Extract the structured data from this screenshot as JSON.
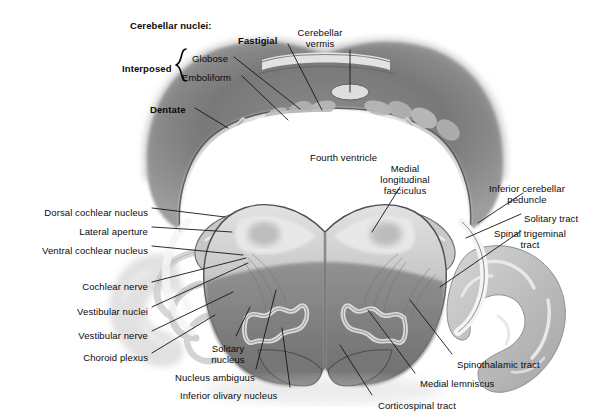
{
  "figure": {
    "domain": "anatomical-illustration",
    "style": "grayscale pencil/airbrush rendering on white background",
    "width": 615,
    "height": 418
  },
  "group_headers": {
    "cerebellar_nuclei": "Cerebellar nuclei:",
    "interposed": "Interposed"
  },
  "labels": [
    {
      "id": "cerebellar-nuclei-header",
      "text": "Cerebellar nuclei:",
      "bold": true,
      "x": 130,
      "y": 20,
      "align": "left"
    },
    {
      "id": "fastigial",
      "text": "Fastigial",
      "bold": true,
      "x": 238,
      "y": 35,
      "align": "left"
    },
    {
      "id": "cerebellar-vermis",
      "text": "Cerebellar\nvermis",
      "bold": false,
      "x": 320,
      "y": 27,
      "align": "center"
    },
    {
      "id": "interposed",
      "text": "Interposed",
      "bold": true,
      "x": 122,
      "y": 63,
      "align": "left"
    },
    {
      "id": "globose",
      "text": "Globose",
      "bold": false,
      "x": 192,
      "y": 53,
      "align": "left"
    },
    {
      "id": "emboliform",
      "text": "Emboliform",
      "bold": false,
      "x": 182,
      "y": 72,
      "align": "left"
    },
    {
      "id": "dentate",
      "text": "Dentate",
      "bold": true,
      "x": 150,
      "y": 104,
      "align": "left"
    },
    {
      "id": "fourth-ventricle",
      "text": "Fourth ventricle",
      "bold": false,
      "x": 310,
      "y": 152,
      "align": "left"
    },
    {
      "id": "medial-longitudinal-fasciculus",
      "text": "Medial\nlongitudinal\nfasciculus",
      "bold": false,
      "x": 405,
      "y": 163,
      "align": "center"
    },
    {
      "id": "inferior-cerebellar-peduncle",
      "text": "Inferior cerebellar\npeduncle",
      "bold": false,
      "x": 527,
      "y": 183,
      "align": "center"
    },
    {
      "id": "solitary-tract",
      "text": "Solitary tract",
      "bold": false,
      "x": 524,
      "y": 213,
      "align": "left"
    },
    {
      "id": "spinal-trigeminal-tract",
      "text": "Spinal trigeminal\ntract",
      "bold": false,
      "x": 530,
      "y": 228,
      "align": "center"
    },
    {
      "id": "dorsal-cochlear-nucleus",
      "text": "Dorsal cochlear nucleus",
      "bold": false,
      "x": 148,
      "y": 207,
      "align": "right"
    },
    {
      "id": "lateral-aperture",
      "text": "Lateral aperture",
      "bold": false,
      "x": 148,
      "y": 226,
      "align": "right"
    },
    {
      "id": "ventral-cochlear-nucleus",
      "text": "Ventral cochlear nucleus",
      "bold": false,
      "x": 148,
      "y": 245,
      "align": "right"
    },
    {
      "id": "cochlear-nerve",
      "text": "Cochlear nerve",
      "bold": false,
      "x": 148,
      "y": 281,
      "align": "right"
    },
    {
      "id": "vestibular-nuclei",
      "text": "Vestibular nuclei",
      "bold": false,
      "x": 148,
      "y": 306,
      "align": "right"
    },
    {
      "id": "vestibular-nerve",
      "text": "Vestibular nerve",
      "bold": false,
      "x": 148,
      "y": 330,
      "align": "right"
    },
    {
      "id": "choroid-plexus",
      "text": "Choroid plexus",
      "bold": false,
      "x": 148,
      "y": 352,
      "align": "right"
    },
    {
      "id": "solitary-nucleus",
      "text": "Solitary\nnucleus",
      "bold": false,
      "x": 228,
      "y": 343,
      "align": "center"
    },
    {
      "id": "nucleus-ambiguus",
      "text": "Nucleus ambiguus",
      "bold": false,
      "x": 175,
      "y": 372,
      "align": "left"
    },
    {
      "id": "inferior-olivary-nucleus",
      "text": "Inferior olivary nucleus",
      "bold": false,
      "x": 180,
      "y": 390,
      "align": "left"
    },
    {
      "id": "corticospinal-tract",
      "text": "Corticospinal tract",
      "bold": false,
      "x": 378,
      "y": 400,
      "align": "left"
    },
    {
      "id": "medial-lemniscus",
      "text": "Medial lemniscus",
      "bold": false,
      "x": 420,
      "y": 378,
      "align": "left"
    },
    {
      "id": "spinothalamic-tract",
      "text": "Spinothalamic tract",
      "bold": false,
      "x": 457,
      "y": 359,
      "align": "left"
    }
  ],
  "leader_lines": [
    {
      "id": "leader-fastigial",
      "from": [
        288,
        44
      ],
      "to": [
        322,
        110
      ]
    },
    {
      "id": "leader-vermis",
      "from": [
        350,
        50
      ],
      "to": [
        350,
        92
      ]
    },
    {
      "id": "leader-globose",
      "from": [
        234,
        57
      ],
      "to": [
        300,
        109
      ]
    },
    {
      "id": "leader-emboliform",
      "from": [
        242,
        76
      ],
      "to": [
        288,
        120
      ]
    },
    {
      "id": "leader-dentate",
      "from": [
        195,
        108
      ],
      "to": [
        228,
        128
      ]
    },
    {
      "id": "leader-mlf",
      "from": [
        400,
        187
      ],
      "to": [
        372,
        232
      ]
    },
    {
      "id": "leader-icp",
      "from": [
        523,
        193
      ],
      "to": [
        478,
        223
      ]
    },
    {
      "id": "leader-sol-tract",
      "from": [
        521,
        214
      ],
      "to": [
        466,
        238
      ]
    },
    {
      "id": "leader-spinal-trig",
      "from": [
        521,
        231
      ],
      "to": [
        440,
        287
      ]
    },
    {
      "id": "leader-dcn",
      "from": [
        152,
        208
      ],
      "to": [
        225,
        217
      ]
    },
    {
      "id": "leader-lat-ap",
      "from": [
        152,
        227
      ],
      "to": [
        232,
        232
      ]
    },
    {
      "id": "leader-vcn",
      "from": [
        152,
        246
      ],
      "to": [
        243,
        255
      ]
    },
    {
      "id": "leader-coch-nerve",
      "from": [
        152,
        282
      ],
      "to": [
        246,
        258
      ]
    },
    {
      "id": "leader-vest-nuclei",
      "from": [
        152,
        307
      ],
      "to": [
        248,
        263
      ]
    },
    {
      "id": "leader-vest-nerve",
      "from": [
        152,
        331
      ],
      "to": [
        233,
        292
      ]
    },
    {
      "id": "leader-choroid",
      "from": [
        152,
        353
      ],
      "to": [
        215,
        315
      ]
    },
    {
      "id": "leader-sol-nucleus",
      "from": [
        236,
        336
      ],
      "to": [
        250,
        307
      ]
    },
    {
      "id": "leader-nuc-amb",
      "from": [
        256,
        369
      ],
      "to": [
        276,
        290
      ]
    },
    {
      "id": "leader-inf-olivary",
      "from": [
        290,
        387
      ],
      "to": [
        282,
        328
      ]
    },
    {
      "id": "leader-cortico",
      "from": [
        372,
        395
      ],
      "to": [
        340,
        345
      ]
    },
    {
      "id": "leader-med-lemn",
      "from": [
        415,
        373
      ],
      "to": [
        368,
        310
      ]
    },
    {
      "id": "leader-spinothal",
      "from": [
        452,
        354
      ],
      "to": [
        410,
        300
      ]
    }
  ],
  "anatomy_regions": [
    {
      "id": "cerebellum-arch",
      "name": "cerebellar hemispheres forming arch above fourth ventricle"
    },
    {
      "id": "fourth-ventricle-cavity",
      "name": "fourth ventricle (white cavity)"
    },
    {
      "id": "vermis-oval",
      "name": "cerebellar vermis small oval at apex"
    },
    {
      "id": "dentate-nucleus-left",
      "name": "left dentate nucleus zigzag band"
    },
    {
      "id": "dentate-nucleus-right",
      "name": "right dentate nucleus zigzag band"
    },
    {
      "id": "medulla-body",
      "name": "medulla oblongata, butterfly-shaped"
    },
    {
      "id": "inferior-olive-left",
      "name": "left inferior olivary nucleus wavy ribbon"
    },
    {
      "id": "inferior-olive-right",
      "name": "right inferior olivary nucleus wavy ribbon"
    },
    {
      "id": "pyramid-left",
      "name": "left medullary pyramid"
    },
    {
      "id": "pyramid-right",
      "name": "right medullary pyramid"
    },
    {
      "id": "cerebellar-tonsil-right",
      "name": "right cerebellar folia / tonsil"
    },
    {
      "id": "cerebellar-tonsil-left",
      "name": "left cerebellar folia / tonsil"
    },
    {
      "id": "choroid-plexus-left",
      "name": "left choroid plexus fronds"
    }
  ],
  "palette": {
    "background": "#ffffff",
    "text": "#0a0a0a",
    "leader_line": "#1a1a1a",
    "tissue_dark": "#6e6e6e",
    "tissue_mid": "#8e8e8e",
    "tissue_light": "#c3c3c3",
    "tissue_pale": "#dcdcdc",
    "ventricle": "#ffffff",
    "outline": "#3a3a3a"
  }
}
